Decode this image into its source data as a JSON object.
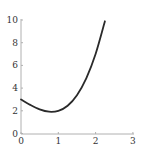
{
  "chart_data": {
    "type": "line",
    "title": "",
    "xlabel": "",
    "ylabel": "",
    "xlim": [
      0,
      3
    ],
    "ylim": [
      0,
      10
    ],
    "grid": false,
    "legend": null,
    "x_ticks": [
      0,
      1,
      2,
      3
    ],
    "y_ticks": [
      0,
      2,
      4,
      6,
      8,
      10
    ],
    "x_tick_labels": [
      "0",
      "1",
      "2",
      "3"
    ],
    "y_tick_labels": [
      "0",
      "2",
      "4",
      "6",
      "8",
      "10"
    ],
    "series": [
      {
        "name": "f(x)",
        "color": "#2a2a2a",
        "x": [
          0,
          0.25,
          0.5,
          0.75,
          1.0,
          1.25,
          1.5,
          1.75,
          2.0,
          2.25
        ],
        "y": [
          3.0,
          2.52,
          2.13,
          1.92,
          2.0,
          2.45,
          3.38,
          4.86,
          7.0,
          9.89
        ]
      }
    ]
  }
}
